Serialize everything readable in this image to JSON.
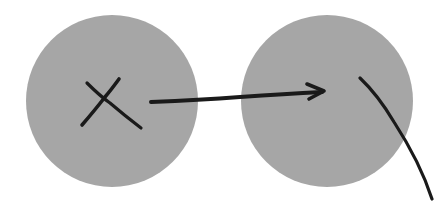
{
  "diagram": {
    "background": "#ffffff",
    "circle_fill": "#a6a6a6",
    "stroke_color": "#1a1a1a",
    "circles": [
      {
        "id": "left-circle",
        "cx": 112,
        "cy": 101,
        "r": 86,
        "mark": "x"
      },
      {
        "id": "right-circle",
        "cx": 327,
        "cy": 101,
        "r": 86,
        "mark": "none"
      }
    ],
    "arrow": {
      "from": "left-circle",
      "to": "right-circle",
      "label": ""
    },
    "curve": {
      "description": "curved line exiting right circle toward bottom-right"
    }
  }
}
